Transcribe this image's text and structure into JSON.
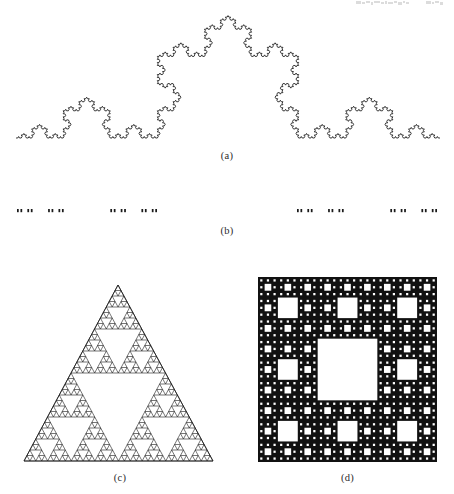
{
  "figure": {
    "background_color": "#ffffff",
    "ink_color": "#1a1a1a",
    "width": 454,
    "height": 494
  },
  "captions": {
    "a": "(a)",
    "b": "(b)",
    "c": "(c)",
    "d": "(d)"
  },
  "panels": [
    {
      "key": "a",
      "caption": "(a)",
      "fractal_name": "koch-curve",
      "title": "Koch curve",
      "iterations": 5,
      "baseline_y": 138,
      "x_start": 16,
      "x_end": 440,
      "apex_y": 16,
      "stroke_width": 0.85,
      "filled": false
    },
    {
      "key": "b",
      "caption": "(b)",
      "fractal_name": "cantor-set",
      "title": "Cantor set",
      "iterations": 5,
      "bar_y": 209,
      "bar_height": 3.2,
      "x_start": 17,
      "x_end": 437,
      "filled": true
    },
    {
      "key": "c",
      "caption": "(c)",
      "fractal_name": "sierpinski-triangle",
      "title": "Sierpinski triangle",
      "iterations": 5,
      "apex_x": 118,
      "apex_y": 285,
      "base_y": 461,
      "base_left_x": 24,
      "base_right_x": 213,
      "stroke_width": 0.6,
      "filled": false
    },
    {
      "key": "d",
      "caption": "(d)",
      "fractal_name": "sierpinski-carpet",
      "title": "Sierpinski carpet",
      "iterations": 4,
      "x": 258,
      "y": 277,
      "size_w": 179,
      "size_h": 185,
      "fill_color": "#111111",
      "hole_color": "#ffffff",
      "filled": true
    }
  ],
  "chart_data": {
    "type": "diagram",
    "items": [
      {
        "label": "(a)",
        "name": "Koch curve",
        "construction": "Each line segment is replaced by four segments of one third length, the middle pair forming an equilateral bump.",
        "iterations": 5,
        "similarity_ratio": "1/3",
        "copies": 4,
        "fractal_dimension": 1.2619
      },
      {
        "label": "(b)",
        "name": "Cantor set",
        "construction": "The middle third of each segment is removed repeatedly.",
        "iterations": 5,
        "similarity_ratio": "1/3",
        "copies": 2,
        "fractal_dimension": 0.6309
      },
      {
        "label": "(c)",
        "name": "Sierpinski triangle",
        "construction": "Each triangle is replaced by three half-scale triangles at its corners.",
        "iterations": 5,
        "similarity_ratio": "1/2",
        "copies": 3,
        "fractal_dimension": 1.585
      },
      {
        "label": "(d)",
        "name": "Sierpinski carpet",
        "construction": "Each square is divided into nine sub-squares and the central one is removed.",
        "iterations": 4,
        "similarity_ratio": "1/3",
        "copies": 8,
        "fractal_dimension": 1.8928
      }
    ]
  },
  "artifact": {
    "description": "faint cropped scan line at top right",
    "visible": true
  }
}
